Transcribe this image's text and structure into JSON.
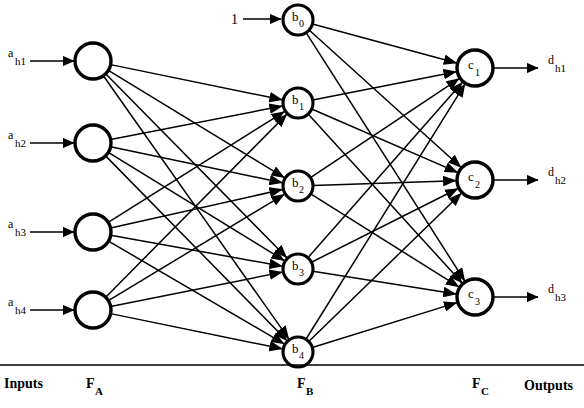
{
  "diagram": {
    "background_color": "#ffffff",
    "stroke_color": "#000000",
    "width": 584,
    "height": 408
  },
  "captions": {
    "inputs": "Inputs",
    "outputs": "Outputs"
  },
  "layer_labels": [
    {
      "name": "layer-label-fa",
      "main": "F",
      "sub": "A",
      "x": 86,
      "y": 388
    },
    {
      "name": "layer-label-fb",
      "main": "F",
      "sub": "B",
      "x": 297,
      "y": 388
    },
    {
      "name": "layer-label-fc",
      "main": "F",
      "sub": "C",
      "x": 472,
      "y": 388
    }
  ],
  "caption_positions": {
    "inputs": {
      "x": 4,
      "y": 388
    },
    "outputs": {
      "x": 524,
      "y": 390
    }
  },
  "bias": {
    "label": "1",
    "label_x": 231,
    "label_y": 24,
    "arrow_from_x": 243,
    "arrow_to_x": 281,
    "y": 19
  },
  "layers": {
    "input": {
      "name": "F_A",
      "radius": 18,
      "cx": 93,
      "nodes": [
        {
          "id": "a-node-1",
          "cy": 61,
          "label_main": "a",
          "label_sub": "h1"
        },
        {
          "id": "a-node-2",
          "cy": 143,
          "label_main": "a",
          "label_sub": "h2"
        },
        {
          "id": "a-node-3",
          "cy": 232,
          "label_main": "a",
          "label_sub": "h3"
        },
        {
          "id": "a-node-4",
          "cy": 310,
          "label_main": "a",
          "label_sub": "h4"
        }
      ]
    },
    "hidden": {
      "name": "F_B",
      "radius": 15,
      "cx": 298,
      "nodes": [
        {
          "id": "b0",
          "cy": 20,
          "label_main": "b",
          "label_sub": "0",
          "is_bias": true
        },
        {
          "id": "b1",
          "cy": 103,
          "label_main": "b",
          "label_sub": "1",
          "is_bias": false
        },
        {
          "id": "b2",
          "cy": 186,
          "label_main": "b",
          "label_sub": "2",
          "is_bias": false
        },
        {
          "id": "b3",
          "cy": 269,
          "label_main": "b",
          "label_sub": "3",
          "is_bias": false
        },
        {
          "id": "b4",
          "cy": 352,
          "label_main": "b",
          "label_sub": "4",
          "is_bias": false
        }
      ]
    },
    "output": {
      "name": "F_C",
      "radius": 18,
      "cx": 475,
      "nodes": [
        {
          "id": "c1",
          "cy": 68,
          "label_main": "c",
          "label_sub": "1",
          "out_main": "d",
          "out_sub": "h1"
        },
        {
          "id": "c2",
          "cy": 180,
          "label_main": "c",
          "label_sub": "2",
          "out_main": "d",
          "out_sub": "h2"
        },
        {
          "id": "c3",
          "cy": 297,
          "label_main": "c",
          "label_sub": "3",
          "out_main": "d",
          "out_sub": "h3"
        }
      ]
    }
  },
  "input_arrows": {
    "label_x": 8,
    "start_x": 30,
    "end_x": 74
  },
  "output_arrows": {
    "start_x": 494,
    "end_x": 538,
    "label_x": 548
  },
  "rule_line": {
    "x1": 0,
    "x2": 584,
    "y": 365
  },
  "connections": {
    "input_to_hidden": "fully connected: each of a_h1..a_h4 to b_1..b_4",
    "hidden_to_output": "fully connected: each of b_0..b_4 to c_1..c_3",
    "input_to_hidden_count": 16,
    "hidden_to_output_count": 15
  }
}
